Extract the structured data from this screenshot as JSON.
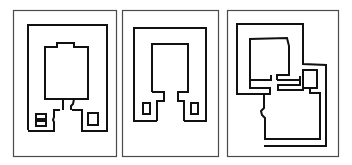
{
  "figure": {
    "type": "floor-plan-diagram",
    "panel_count": 3,
    "colors": {
      "background": "#ffffff",
      "frame": "#4a4a4a",
      "wall": "#111111"
    },
    "panels": [
      {
        "id": "plan-1",
        "description": "Rectangular enclosure with central room, notched top, connecting passage and two small side rooms"
      },
      {
        "id": "plan-2",
        "description": "Rectangular enclosure with central room on a stepped pedestal and two small rooms"
      },
      {
        "id": "plan-3",
        "description": "Irregular enclosure with split central rooms and extended L-shaped lower area"
      }
    ]
  }
}
